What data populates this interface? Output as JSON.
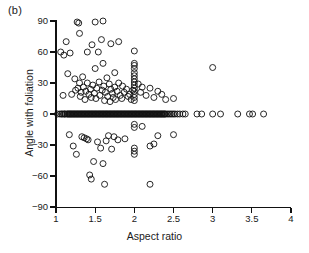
{
  "figure": {
    "panel_label": "(b)",
    "background_color": "#ffffff",
    "marker_color": "#111111"
  },
  "chart_data": {
    "type": "scatter",
    "title": "",
    "panel": "(b)",
    "xlabel": "Aspect ratio",
    "ylabel": "Angle with foliation",
    "xlim": [
      1,
      4
    ],
    "ylim": [
      -90,
      90
    ],
    "xticks": [
      1,
      1.5,
      2,
      2.5,
      3,
      3.5,
      4
    ],
    "xticklabels": [
      "1",
      "1.5",
      "2",
      "2.5",
      "3",
      "3.5",
      "4"
    ],
    "yticks": [
      90,
      60,
      30,
      0,
      -30,
      -60,
      -90
    ],
    "yticklabels": [
      "90",
      "60",
      "30",
      "0",
      "-30",
      "-60",
      "-90"
    ],
    "grid": false,
    "legend": null,
    "marker": "open-circle",
    "marker_size": 6,
    "points": [
      [
        1.02,
        0
      ],
      [
        1.05,
        0
      ],
      [
        1.06,
        60
      ],
      [
        1.07,
        0
      ],
      [
        1.08,
        0
      ],
      [
        1.09,
        18
      ],
      [
        1.1,
        0
      ],
      [
        1.1,
        57
      ],
      [
        1.11,
        0
      ],
      [
        1.12,
        0
      ],
      [
        1.13,
        70
      ],
      [
        1.14,
        0
      ],
      [
        1.15,
        0
      ],
      [
        1.15,
        39
      ],
      [
        1.16,
        0
      ],
      [
        1.17,
        0
      ],
      [
        1.17,
        -20
      ],
      [
        1.18,
        0
      ],
      [
        1.18,
        59
      ],
      [
        1.19,
        0
      ],
      [
        1.2,
        0
      ],
      [
        1.2,
        19
      ],
      [
        1.21,
        0
      ],
      [
        1.22,
        0
      ],
      [
        1.22,
        -31
      ],
      [
        1.23,
        0
      ],
      [
        1.24,
        0
      ],
      [
        1.24,
        34
      ],
      [
        1.25,
        0
      ],
      [
        1.25,
        23
      ],
      [
        1.26,
        0
      ],
      [
        1.26,
        -39
      ],
      [
        1.27,
        0
      ],
      [
        1.27,
        89
      ],
      [
        1.28,
        0
      ],
      [
        1.28,
        25
      ],
      [
        1.29,
        0
      ],
      [
        1.29,
        88
      ],
      [
        1.3,
        0
      ],
      [
        1.3,
        30
      ],
      [
        1.3,
        78
      ],
      [
        1.31,
        0
      ],
      [
        1.31,
        17
      ],
      [
        1.32,
        0
      ],
      [
        1.32,
        21
      ],
      [
        1.33,
        0
      ],
      [
        1.33,
        -22
      ],
      [
        1.34,
        0
      ],
      [
        1.34,
        36
      ],
      [
        1.35,
        0
      ],
      [
        1.35,
        26
      ],
      [
        1.36,
        0
      ],
      [
        1.36,
        -23
      ],
      [
        1.37,
        0
      ],
      [
        1.37,
        14
      ],
      [
        1.38,
        0
      ],
      [
        1.38,
        22
      ],
      [
        1.39,
        0
      ],
      [
        1.39,
        -24
      ],
      [
        1.4,
        0
      ],
      [
        1.4,
        60
      ],
      [
        1.4,
        30
      ],
      [
        1.41,
        0
      ],
      [
        1.41,
        -25
      ],
      [
        1.42,
        0
      ],
      [
        1.42,
        19
      ],
      [
        1.43,
        0
      ],
      [
        1.43,
        -59
      ],
      [
        1.44,
        0
      ],
      [
        1.44,
        24
      ],
      [
        1.45,
        0
      ],
      [
        1.45,
        16
      ],
      [
        1.45,
        -63
      ],
      [
        1.46,
        0
      ],
      [
        1.46,
        67
      ],
      [
        1.47,
        0
      ],
      [
        1.47,
        28
      ],
      [
        1.48,
        0
      ],
      [
        1.48,
        -46
      ],
      [
        1.49,
        0
      ],
      [
        1.49,
        20
      ],
      [
        1.5,
        0
      ],
      [
        1.5,
        89
      ],
      [
        1.5,
        44
      ],
      [
        1.51,
        0
      ],
      [
        1.51,
        15
      ],
      [
        1.52,
        0
      ],
      [
        1.52,
        25
      ],
      [
        1.53,
        0
      ],
      [
        1.53,
        -27
      ],
      [
        1.54,
        0
      ],
      [
        1.54,
        60
      ],
      [
        1.55,
        0
      ],
      [
        1.55,
        31
      ],
      [
        1.56,
        0
      ],
      [
        1.56,
        18
      ],
      [
        1.57,
        0
      ],
      [
        1.57,
        -33
      ],
      [
        1.58,
        0
      ],
      [
        1.58,
        72
      ],
      [
        1.59,
        0
      ],
      [
        1.59,
        23
      ],
      [
        1.6,
        0
      ],
      [
        1.6,
        90
      ],
      [
        1.6,
        49
      ],
      [
        1.6,
        -48
      ],
      [
        1.61,
        0
      ],
      [
        1.61,
        27
      ],
      [
        1.62,
        0
      ],
      [
        1.62,
        13
      ],
      [
        1.62,
        -68
      ],
      [
        1.63,
        0
      ],
      [
        1.63,
        21
      ],
      [
        1.64,
        0
      ],
      [
        1.64,
        -26
      ],
      [
        1.65,
        0
      ],
      [
        1.65,
        35
      ],
      [
        1.66,
        0
      ],
      [
        1.66,
        17
      ],
      [
        1.67,
        0
      ],
      [
        1.67,
        -21
      ],
      [
        1.68,
        0
      ],
      [
        1.68,
        29
      ],
      [
        1.69,
        0
      ],
      [
        1.69,
        12
      ],
      [
        1.7,
        0
      ],
      [
        1.7,
        68
      ],
      [
        1.7,
        24
      ],
      [
        1.71,
        0
      ],
      [
        1.71,
        -34
      ],
      [
        1.72,
        0
      ],
      [
        1.72,
        20
      ],
      [
        1.73,
        0
      ],
      [
        1.73,
        16
      ],
      [
        1.74,
        0
      ],
      [
        1.74,
        -22
      ],
      [
        1.75,
        0
      ],
      [
        1.75,
        40
      ],
      [
        1.75,
        26
      ],
      [
        1.76,
        0
      ],
      [
        1.76,
        14
      ],
      [
        1.77,
        0
      ],
      [
        1.78,
        0
      ],
      [
        1.78,
        22
      ],
      [
        1.79,
        0
      ],
      [
        1.79,
        -25
      ],
      [
        1.8,
        0
      ],
      [
        1.8,
        70
      ],
      [
        1.8,
        30
      ],
      [
        1.81,
        0
      ],
      [
        1.82,
        0
      ],
      [
        1.82,
        18
      ],
      [
        1.83,
        0
      ],
      [
        1.84,
        0
      ],
      [
        1.84,
        15
      ],
      [
        1.85,
        0
      ],
      [
        1.85,
        27
      ],
      [
        1.86,
        0
      ],
      [
        1.87,
        0
      ],
      [
        1.87,
        21
      ],
      [
        1.88,
        0
      ],
      [
        1.88,
        -24
      ],
      [
        1.89,
        0
      ],
      [
        1.9,
        0
      ],
      [
        1.9,
        24
      ],
      [
        1.91,
        0
      ],
      [
        1.92,
        0
      ],
      [
        1.92,
        17
      ],
      [
        1.93,
        0
      ],
      [
        1.94,
        0
      ],
      [
        1.94,
        19
      ],
      [
        1.95,
        0
      ],
      [
        1.96,
        0
      ],
      [
        1.96,
        14
      ],
      [
        1.97,
        0
      ],
      [
        1.98,
        0
      ],
      [
        1.98,
        23
      ],
      [
        1.99,
        0
      ],
      [
        2.0,
        0
      ],
      [
        2.0,
        61
      ],
      [
        2.0,
        49
      ],
      [
        2.0,
        47
      ],
      [
        2.0,
        44
      ],
      [
        2.0,
        40
      ],
      [
        2.0,
        37
      ],
      [
        2.0,
        34
      ],
      [
        2.0,
        31
      ],
      [
        2.0,
        28
      ],
      [
        2.0,
        25
      ],
      [
        2.0,
        22
      ],
      [
        2.0,
        19
      ],
      [
        2.0,
        16
      ],
      [
        2.0,
        13
      ],
      [
        2.0,
        -10
      ],
      [
        2.0,
        -13
      ],
      [
        2.0,
        -33
      ],
      [
        2.0,
        -36
      ],
      [
        2.0,
        -39
      ],
      [
        2.01,
        0
      ],
      [
        2.02,
        0
      ],
      [
        2.03,
        0
      ],
      [
        2.04,
        0
      ],
      [
        2.05,
        0
      ],
      [
        2.05,
        29
      ],
      [
        2.06,
        0
      ],
      [
        2.07,
        0
      ],
      [
        2.08,
        0
      ],
      [
        2.08,
        21
      ],
      [
        2.09,
        0
      ],
      [
        2.1,
        0
      ],
      [
        2.1,
        26
      ],
      [
        2.1,
        -12
      ],
      [
        2.11,
        0
      ],
      [
        2.12,
        0
      ],
      [
        2.13,
        0
      ],
      [
        2.14,
        0
      ],
      [
        2.15,
        0
      ],
      [
        2.15,
        18
      ],
      [
        2.16,
        0
      ],
      [
        2.17,
        0
      ],
      [
        2.18,
        0
      ],
      [
        2.19,
        0
      ],
      [
        2.2,
        0
      ],
      [
        2.2,
        25
      ],
      [
        2.2,
        -31
      ],
      [
        2.2,
        -68
      ],
      [
        2.21,
        0
      ],
      [
        2.22,
        0
      ],
      [
        2.23,
        0
      ],
      [
        2.24,
        0
      ],
      [
        2.25,
        0
      ],
      [
        2.25,
        16
      ],
      [
        2.25,
        -29
      ],
      [
        2.26,
        0
      ],
      [
        2.27,
        0
      ],
      [
        2.28,
        0
      ],
      [
        2.29,
        0
      ],
      [
        2.3,
        0
      ],
      [
        2.3,
        22
      ],
      [
        2.3,
        -21
      ],
      [
        2.31,
        0
      ],
      [
        2.32,
        0
      ],
      [
        2.33,
        0
      ],
      [
        2.34,
        0
      ],
      [
        2.35,
        0
      ],
      [
        2.35,
        19
      ],
      [
        2.36,
        0
      ],
      [
        2.37,
        0
      ],
      [
        2.38,
        0
      ],
      [
        2.39,
        0
      ],
      [
        2.4,
        0
      ],
      [
        2.4,
        14
      ],
      [
        2.42,
        0
      ],
      [
        2.44,
        0
      ],
      [
        2.46,
        0
      ],
      [
        2.48,
        0
      ],
      [
        2.5,
        0
      ],
      [
        2.5,
        15
      ],
      [
        2.5,
        -20
      ],
      [
        2.52,
        0
      ],
      [
        2.55,
        0
      ],
      [
        2.58,
        0
      ],
      [
        2.62,
        0
      ],
      [
        2.65,
        0
      ],
      [
        2.8,
        0
      ],
      [
        2.86,
        0
      ],
      [
        3.0,
        0
      ],
      [
        3.0,
        45
      ],
      [
        3.1,
        0
      ],
      [
        3.32,
        0
      ],
      [
        3.47,
        0
      ],
      [
        3.51,
        0
      ],
      [
        3.65,
        0
      ]
    ]
  },
  "axes": {
    "x_title": "Aspect ratio",
    "y_title": "Angle with foliation"
  }
}
